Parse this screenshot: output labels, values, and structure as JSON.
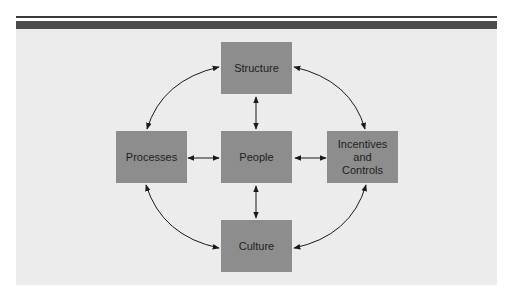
{
  "diagram": {
    "colors": {
      "panel": "#ececec",
      "box": "#8d8d8d",
      "rule": "#3a3a3a",
      "text": "#1e1e1e",
      "arrow": "#1a1a1a"
    },
    "nodes": [
      {
        "id": "structure",
        "label": "Structure"
      },
      {
        "id": "processes",
        "label": "Processes"
      },
      {
        "id": "people",
        "label": "People"
      },
      {
        "id": "incentives",
        "label": "Incentives and Controls",
        "lines": [
          "Incentives",
          "and",
          "Controls"
        ]
      },
      {
        "id": "culture",
        "label": "Culture"
      }
    ],
    "edges": [
      {
        "from": "structure",
        "to": "processes",
        "type": "curved",
        "bidirectional": true
      },
      {
        "from": "structure",
        "to": "incentives",
        "type": "curved",
        "bidirectional": true
      },
      {
        "from": "processes",
        "to": "culture",
        "type": "curved",
        "bidirectional": true
      },
      {
        "from": "incentives",
        "to": "culture",
        "type": "curved",
        "bidirectional": true
      },
      {
        "from": "structure",
        "to": "people",
        "type": "straight",
        "bidirectional": true
      },
      {
        "from": "processes",
        "to": "people",
        "type": "straight",
        "bidirectional": true
      },
      {
        "from": "people",
        "to": "incentives",
        "type": "straight",
        "bidirectional": true
      },
      {
        "from": "people",
        "to": "culture",
        "type": "straight",
        "bidirectional": true
      }
    ]
  }
}
